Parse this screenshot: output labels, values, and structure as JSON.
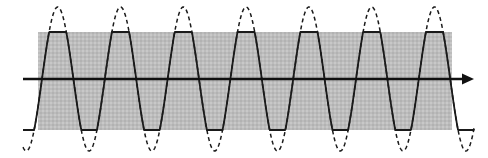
{
  "figure": {
    "canvas": {
      "width": 488,
      "height": 158,
      "background": "#ffffff"
    },
    "colors": {
      "band_fill": "#b9b9b9",
      "band_fill_alt": "#c6c6c6",
      "curve_stroke": "#1a1a1a",
      "axis_stroke": "#111111",
      "background": "#ffffff"
    },
    "clipping_band": {
      "label": "clipping-band",
      "x": 38,
      "y": 32,
      "width": 414,
      "height": 98,
      "top_edge_y": 32,
      "bottom_edge_y": 130
    },
    "axis": {
      "label": "horizontal-axis-arrow",
      "y": 79,
      "x_start": 23,
      "x_end": 474,
      "stroke_width": 2.4,
      "arrowhead": {
        "tip_x": 474,
        "back_x": 462,
        "half_height": 5.5
      }
    }
  },
  "chart_data": {
    "type": "line",
    "title": "",
    "xlabel": "",
    "ylabel": "",
    "grid": false,
    "legend_position": "none",
    "xlim": [
      0,
      488
    ],
    "ylim": [
      158,
      0
    ],
    "annotations": [
      "Dashed curve: unclipped sinusoid of full amplitude",
      "Solid curve: same sinusoid hard-clipped (saturated) at the shaded band limits",
      "Shaded band marks the linear (non-saturating) operating region",
      "Horizontal arrow is the time axis pointing right"
    ],
    "wave": {
      "baseline_y": 79,
      "sine_amplitude_px": 72,
      "clip_amplitude_px": 47,
      "period_px": 62.8,
      "phase_offset_px": 42,
      "x_start": 23,
      "x_end": 474,
      "visible_full_peaks": 6,
      "visible_full_troughs": 6,
      "peaks_x": [
        57,
        120,
        183,
        246,
        309,
        372,
        435
      ],
      "troughs_x": [
        88,
        151,
        214,
        277,
        340,
        403
      ],
      "clip_top_y": 32,
      "clip_bottom_y": 130
    },
    "series": [
      {
        "name": "unclipped-sine",
        "style": "dashed",
        "stroke": "#1a1a1a",
        "stroke_width": 1.5,
        "dash_pattern": [
          4,
          3.2
        ],
        "amplitude_px": 72
      },
      {
        "name": "clipped-sine",
        "style": "solid",
        "stroke": "#1a1a1a",
        "stroke_width": 1.8,
        "amplitude_px": 47
      }
    ]
  }
}
